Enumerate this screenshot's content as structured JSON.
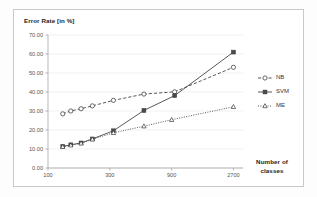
{
  "figure": {
    "title": "",
    "y_axis_title": "Error Rate [in %]",
    "x_axis_title_line1": "Number of",
    "x_axis_title_line2": "classes",
    "frame_color": "#c8c8c8",
    "grid_color": "#e3e3e3",
    "axis_color": "#9a9a9a",
    "text_color": "#555555"
  },
  "chart_data": {
    "type": "line",
    "title": "Error Rate [in %]",
    "xlabel": "Number of classes",
    "ylabel": "Error Rate [in %]",
    "xscale": "log",
    "xlim": [
      100,
      3200
    ],
    "ylim": [
      0,
      70
    ],
    "yticks": [
      "0.00",
      "10.00",
      "20.00",
      "30.00",
      "40.00",
      "50.00",
      "60.00",
      "70.00"
    ],
    "ytick_values": [
      0,
      10,
      20,
      30,
      40,
      50,
      60,
      70
    ],
    "xticks": [
      "100",
      "300",
      "900",
      "2700"
    ],
    "xtick_values": [
      100,
      300,
      900,
      2700
    ],
    "grid": true,
    "grid_axis": "y",
    "legend_position": "right",
    "series": [
      {
        "name": "NB",
        "marker": "open-circle",
        "linestyle": "dashed",
        "color": "#3a3a3a",
        "x": [
          130,
          150,
          180,
          220,
          320,
          550,
          950,
          2700
        ],
        "y": [
          28.5,
          30.0,
          31.2,
          32.7,
          35.6,
          38.9,
          40.1,
          53.0
        ]
      },
      {
        "name": "SVM",
        "marker": "filled-square",
        "linestyle": "solid",
        "color": "#3a3a3a",
        "x": [
          130,
          150,
          180,
          220,
          320,
          550,
          950,
          2700
        ],
        "y": [
          11.3,
          12.2,
          13.2,
          15.3,
          19.6,
          30.3,
          38.1,
          61.0
        ]
      },
      {
        "name": "ME",
        "marker": "open-triangle",
        "linestyle": "dotted",
        "color": "#3a3a3a",
        "x": [
          130,
          150,
          180,
          220,
          320,
          550,
          900,
          2700
        ],
        "y": [
          11.2,
          12.0,
          13.0,
          15.1,
          18.5,
          22.0,
          25.4,
          32.2
        ]
      }
    ]
  },
  "legend": {
    "items": [
      {
        "label": "NB",
        "marker": "open-circle",
        "linestyle": "dashed"
      },
      {
        "label": "SVM",
        "marker": "filled-square",
        "linestyle": "solid"
      },
      {
        "label": "ME",
        "marker": "open-triangle",
        "linestyle": "dotted"
      }
    ]
  }
}
